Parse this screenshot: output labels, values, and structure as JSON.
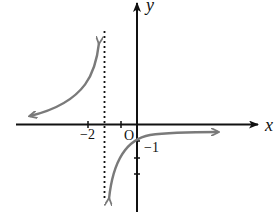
{
  "diagram": {
    "type": "function-graph",
    "axes": {
      "x_label": "x",
      "y_label": "y",
      "origin_label": "O"
    },
    "tick_labels": {
      "x_neg2": "−2",
      "y_neg1": "−1"
    },
    "asymptote": {
      "style": "dotted",
      "orientation": "vertical",
      "at_x": -2
    },
    "curve_color": "#7a7a7a",
    "axis_color": "#111111"
  }
}
